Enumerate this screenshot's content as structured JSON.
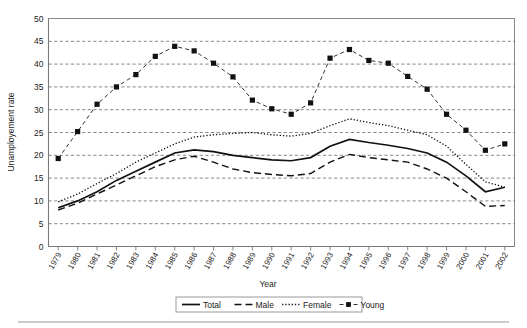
{
  "chart_data": {
    "type": "line",
    "title": "",
    "xlabel": "Year",
    "ylabel": "Unamployement rate",
    "ylim": [
      0,
      50
    ],
    "ytick_step": 5,
    "yticks": [
      0,
      5,
      10,
      15,
      20,
      25,
      30,
      35,
      40,
      45,
      50
    ],
    "grid": true,
    "legend_position": "bottom",
    "categories": [
      "1979",
      "1980",
      "1981",
      "1982",
      "1983",
      "1984",
      "1985",
      "1986",
      "1987",
      "1988",
      "1989",
      "1990",
      "1991",
      "1992",
      "1993",
      "1994",
      "1995",
      "1996",
      "1997",
      "1998",
      "1999",
      "2000",
      "2001",
      "2002"
    ],
    "series": [
      {
        "name": "Total",
        "style": "solid",
        "marker": "none",
        "values": [
          8.5,
          10.0,
          12.0,
          14.5,
          16.5,
          18.5,
          20.5,
          21.2,
          20.8,
          20.0,
          19.5,
          19.0,
          18.8,
          19.5,
          22.0,
          23.5,
          22.8,
          22.2,
          21.5,
          20.5,
          18.5,
          15.5,
          12.0,
          13.0
        ]
      },
      {
        "name": "Male",
        "style": "dashed",
        "marker": "none",
        "values": [
          8.0,
          9.5,
          11.5,
          13.5,
          15.5,
          17.5,
          19.0,
          19.8,
          18.5,
          17.0,
          16.2,
          15.8,
          15.5,
          16.0,
          18.5,
          20.2,
          19.5,
          19.0,
          18.5,
          17.0,
          15.0,
          12.0,
          8.8,
          9.0
        ]
      },
      {
        "name": "Female",
        "style": "dotted",
        "marker": "none",
        "values": [
          9.8,
          11.5,
          13.8,
          16.0,
          18.5,
          20.5,
          22.5,
          24.0,
          24.5,
          24.8,
          25.0,
          24.5,
          24.2,
          24.8,
          26.5,
          28.0,
          27.2,
          26.5,
          25.5,
          24.5,
          22.0,
          18.0,
          14.2,
          13.0
        ]
      },
      {
        "name": "Young",
        "style": "dash-dot",
        "marker": "square",
        "values": [
          19.3,
          25.2,
          31.2,
          35.0,
          37.7,
          41.7,
          43.9,
          42.9,
          40.2,
          37.2,
          32.1,
          30.2,
          29.0,
          31.5,
          41.3,
          43.2,
          40.8,
          40.2,
          37.3,
          34.5,
          29.0,
          25.5,
          21.1,
          22.5
        ]
      }
    ],
    "legend": [
      {
        "label": "Total",
        "style": "solid",
        "marker": "none"
      },
      {
        "label": "Male",
        "style": "dashed",
        "marker": "none"
      },
      {
        "label": "Female",
        "style": "dotted",
        "marker": "none"
      },
      {
        "label": "Young",
        "style": "dash-dot",
        "marker": "square"
      }
    ]
  }
}
